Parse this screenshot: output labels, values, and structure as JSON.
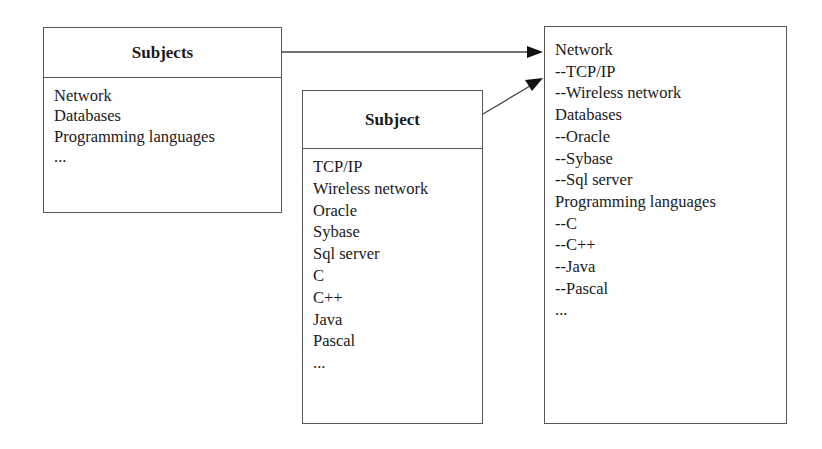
{
  "diagram": {
    "subjects_box": {
      "title": "Subjects",
      "items": [
        "Network",
        "Databases",
        "Programming languages",
        "..."
      ]
    },
    "subject_box": {
      "title": "Subject",
      "items": [
        "TCP/IP",
        "Wireless network",
        "Oracle",
        "Sybase",
        "Sql server",
        "C",
        "C++",
        "Java",
        "Pascal",
        "..."
      ]
    },
    "result_box": {
      "items": [
        "Network",
        "--TCP/IP",
        "--Wireless network",
        "Databases",
        "--Oracle",
        "--Sybase",
        "--Sql server",
        "Programming languages",
        "--C",
        "--C++",
        "--Java",
        "--Pascal",
        "..."
      ]
    },
    "edges": [
      {
        "from": "Subjects",
        "to": "result",
        "type": "arrow"
      },
      {
        "from": "Subject",
        "to": "result",
        "type": "arrow"
      }
    ],
    "colors": {
      "line": "#555555",
      "text": "#1a1a1a",
      "arrowhead": "#111111"
    }
  }
}
